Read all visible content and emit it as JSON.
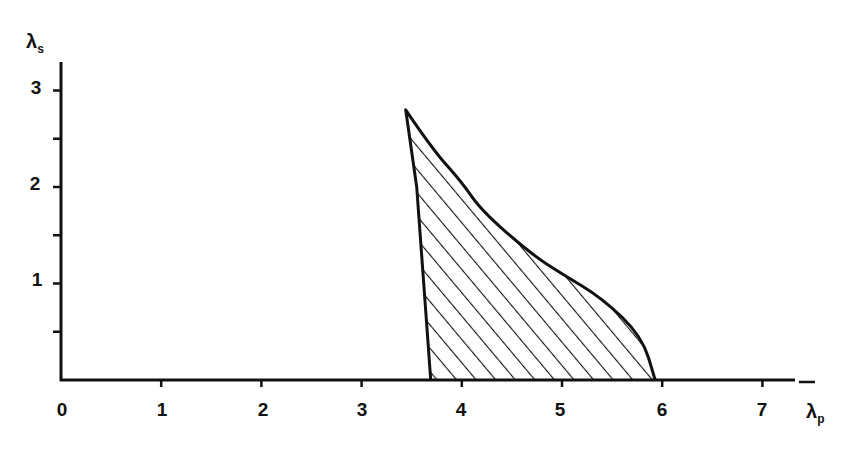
{
  "chart_data": {
    "type": "area",
    "title": "",
    "xlabel": "λp",
    "ylabel": "λs",
    "xlim": [
      0,
      7.4
    ],
    "ylim": [
      0,
      3.1
    ],
    "grid": false,
    "x_ticks": [
      "0",
      "1",
      "2",
      "3",
      "4",
      "5",
      "6",
      "7"
    ],
    "y_ticks": [
      "1",
      "2",
      "3"
    ],
    "region": {
      "description": "Hatched stability region bounded by left boundary (nearly vertical) and upper-right curve",
      "fill": "diagonal hatch",
      "left_boundary": [
        {
          "x": 3.69,
          "y": 0.0
        },
        {
          "x": 3.62,
          "y": 1.0
        },
        {
          "x": 3.55,
          "y": 2.0
        },
        {
          "x": 3.44,
          "y": 2.8
        }
      ],
      "upper_boundary": [
        {
          "x": 3.44,
          "y": 2.8
        },
        {
          "x": 3.7,
          "y": 2.4
        },
        {
          "x": 4.0,
          "y": 2.05
        },
        {
          "x": 4.2,
          "y": 1.75
        },
        {
          "x": 4.7,
          "y": 1.3
        },
        {
          "x": 5.0,
          "y": 1.1
        },
        {
          "x": 5.4,
          "y": 0.85
        },
        {
          "x": 5.8,
          "y": 0.45
        },
        {
          "x": 5.93,
          "y": 0.0
        }
      ]
    }
  },
  "labels": {
    "x_axis": "λ",
    "x_axis_sub": "p",
    "y_axis": "λ",
    "y_axis_sub": "s",
    "x_tick_0": "0",
    "x_tick_1": "1",
    "x_tick_2": "2",
    "x_tick_3": "3",
    "x_tick_4": "4",
    "x_tick_5": "5",
    "x_tick_6": "6",
    "x_tick_7": "7",
    "y_tick_1": "1",
    "y_tick_2": "2",
    "y_tick_3": "3"
  }
}
